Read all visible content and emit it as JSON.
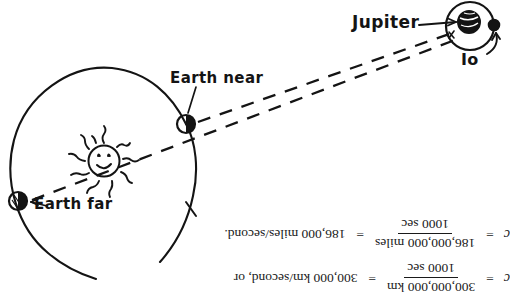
{
  "diagram": {
    "ink_color": "#141414",
    "background_color": "#ffffff",
    "labels": {
      "earth_near": "Earth near",
      "earth_far": "Earth far",
      "jupiter": "Jupiter",
      "io": "Io"
    },
    "elements": {
      "sun": "sun-smiley-face",
      "earth_orbit": "earth-orbit-circle",
      "io_orbit": "io-orbit-circle",
      "sight_line_near": "dashed-sight-line-earth-near-to-jupiter",
      "sight_line_far": "dashed-sight-line-earth-far-to-jupiter"
    }
  },
  "equations": [
    {
      "id": "equation-km",
      "lhs": "c",
      "equals_1": "=",
      "numerator": "300,000,000 km",
      "denominator": "1000 sec",
      "equals_2": "=",
      "result": "300,000 km/second, or"
    },
    {
      "id": "equation-miles",
      "lhs": "c",
      "equals_1": "=",
      "numerator": "186,000,000 miles",
      "denominator": "1000 sec",
      "equals_2": "=",
      "result": "186,000 miles/second."
    }
  ]
}
